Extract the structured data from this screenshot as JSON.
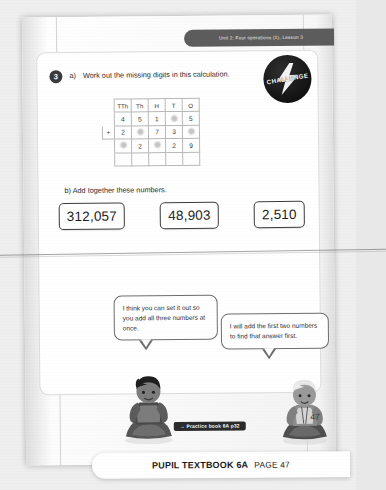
{
  "page": {
    "unit_banner": "Unit 2: Four operations (1), Lesson 3",
    "question_number": "3",
    "page_number": "47"
  },
  "question": {
    "part_a_label": "a)",
    "part_a_text": "Work out the missing digits in this calculation.",
    "part_b_label": "b)",
    "part_b_text": "Add together these numbers."
  },
  "badge": {
    "challenge_label": "CHALLENGE",
    "bolt_icon": "lightning-bolt-icon",
    "color": "#121212"
  },
  "place_value_table": {
    "headers": [
      "",
      "TTh",
      "Th",
      "H",
      "T",
      "O"
    ],
    "rows": [
      {
        "sign": "",
        "cells": [
          "4",
          "5",
          "1",
          "",
          "5"
        ]
      },
      {
        "sign": "+",
        "cells": [
          "2",
          "",
          "7",
          "3",
          ""
        ]
      },
      {
        "sign": "",
        "cells": [
          "",
          "2",
          "",
          "2",
          "9"
        ]
      },
      {
        "sign": "",
        "cells": [
          "",
          "",
          "",
          "",
          ""
        ]
      }
    ],
    "missing_cells_note": "blank"
  },
  "numbers": [
    {
      "value": "312,057"
    },
    {
      "value": "48,903"
    },
    {
      "value": "2,510"
    }
  ],
  "speech_bubbles": [
    {
      "speaker": "child-dark-hair",
      "text": "I think you can set it out so you add all three numbers at once."
    },
    {
      "speaker": "child-light-hair",
      "text": "I will add the first two numbers to find that answer first."
    }
  ],
  "footer": {
    "practice_link": "→ Practice book 6A p32",
    "caption_title": "PUPIL TEXTBOOK 6A",
    "caption_page": "PAGE 47"
  }
}
